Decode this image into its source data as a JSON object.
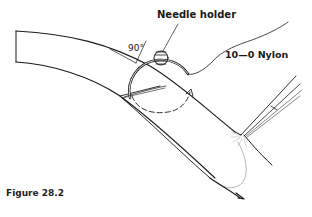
{
  "figure": {
    "caption": "Figure 28.2",
    "type": "surgical illustration",
    "labels": {
      "needle_holder": "Needle holder",
      "suture": "10—0 Nylon",
      "angle": "90°"
    },
    "elements": [
      "curved tissue flap (upper edge)",
      "curved tissue flap (lower edge)",
      "curved suture needle",
      "needle holder tip (cross-section)",
      "suture thread",
      "dashed rotation arrow",
      "forceps",
      "90-degree angle indicator"
    ],
    "colors": {
      "line": "#1a1a1a",
      "background": "#ffffff",
      "fine_line": "#888888"
    }
  }
}
